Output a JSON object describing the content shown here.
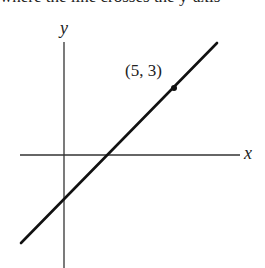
{
  "header": {
    "clipped_text": "where the line crosses the y-axis"
  },
  "graph": {
    "x_axis_label": "x",
    "y_axis_label": "y",
    "point_label": "(5, 3)",
    "point": {
      "x": 5,
      "y": 3
    },
    "line_color": "#111111",
    "axis_color": "#333333"
  }
}
